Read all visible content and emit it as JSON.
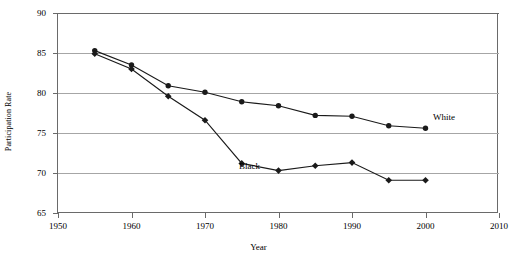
{
  "chart_data": {
    "type": "line",
    "title": "",
    "xlabel": "Year",
    "ylabel": "Participation Rate",
    "xlim": [
      1950,
      2010
    ],
    "ylim": [
      65,
      90
    ],
    "xticks": [
      "1950",
      "1960",
      "1970",
      "1980",
      "1990",
      "2000",
      "2010"
    ],
    "yticks": [
      "65",
      "70",
      "75",
      "80",
      "85",
      "90"
    ],
    "grid": true,
    "legend_position": "inline-annotations",
    "x": [
      1955,
      1960,
      1965,
      1970,
      1975,
      1980,
      1985,
      1990,
      1995,
      2000
    ],
    "series": [
      {
        "name": "White",
        "marker": "circle",
        "label": "White",
        "values": [
          85.3,
          83.5,
          80.9,
          80.1,
          78.9,
          78.4,
          77.2,
          77.1,
          75.9,
          75.6
        ]
      },
      {
        "name": "Black",
        "marker": "diamond",
        "label": "Black",
        "values": [
          84.9,
          83.0,
          79.6,
          76.6,
          71.2,
          70.3,
          70.9,
          71.3,
          69.1,
          69.1
        ]
      }
    ],
    "annotations": [
      {
        "text": "White",
        "x": 1991,
        "y": 78.4
      },
      {
        "text": "Black",
        "x": 1967,
        "y": 71.9
      }
    ]
  },
  "axes": {
    "y_title": "Participation Rate",
    "x_title": "Year",
    "y_tick_labels": [
      "90",
      "85",
      "80",
      "75",
      "70",
      "65"
    ],
    "x_tick_labels": [
      "1950",
      "1960",
      "1970",
      "1980",
      "1990",
      "2000",
      "2010"
    ]
  },
  "labels": {
    "white": "White",
    "black": "Black"
  },
  "top_caption": ""
}
